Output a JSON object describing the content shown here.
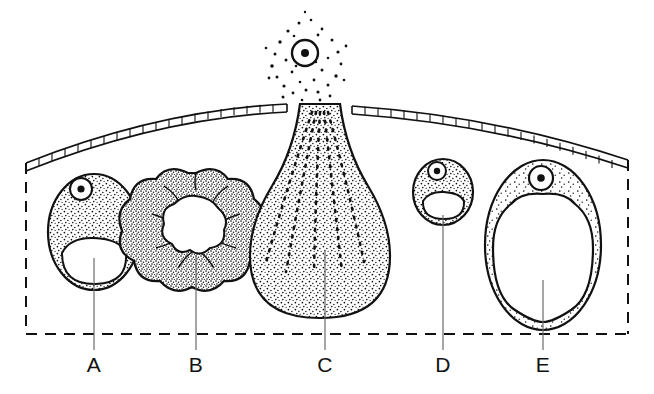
{
  "figure": {
    "title_text": "",
    "kind": "secretory-gland-cell-types-diagram",
    "background_color": "#ffffff",
    "ink_color": "#000000",
    "leader_color": "#6b6b6b"
  },
  "boundary": {
    "name": "tissue-boundary",
    "style": "dashed",
    "left_x": 26,
    "right_x": 628,
    "bottom_y": 334,
    "left_top_y": 163,
    "right_top_y": 160,
    "dash_pattern": "11 8"
  },
  "membrane": {
    "name": "basement-membrane",
    "description": "ladder-hatched arched membrane with a rupture gap at cell C",
    "gap_start_x": 287,
    "gap_end_x": 352,
    "left_start": {
      "x": 26,
      "y": 163
    },
    "apex": {
      "x": 300,
      "y": 105
    },
    "right_end": {
      "x": 628,
      "y": 160
    },
    "rungs": true
  },
  "cells": [
    {
      "id": "A",
      "name": "cell-a",
      "label": "A",
      "type": "resting-cell-with-vacuole",
      "center": {
        "x": 94,
        "y": 232
      },
      "radius_x": 46,
      "radius_y": 58,
      "cytoplasm": "stippled",
      "nucleus": {
        "x": 81,
        "y": 189,
        "r": 11,
        "visible": true
      },
      "vacuole": "crescent-lumen",
      "label_x": 94,
      "label_y": 372,
      "leader_from_y": 258,
      "leader_to_y": 350
    },
    {
      "id": "B",
      "name": "cell-b",
      "label": "B",
      "type": "lobulated-rosette-cell",
      "center": {
        "x": 196,
        "y": 225
      },
      "radius_x": 47,
      "radius_y": 52,
      "cytoplasm": "dense-stippled-lobed",
      "lobe_count": 10,
      "nucleus": {
        "visible": false
      },
      "vacuole": "star-shaped-central-lumen",
      "label_x": 196,
      "label_y": 372,
      "leader_from_y": 255,
      "leader_to_y": 350
    },
    {
      "id": "C",
      "name": "cell-c",
      "label": "C",
      "type": "discharging-flask-cell",
      "center": {
        "x": 320,
        "y": 235
      },
      "radius_x": 65,
      "radius_y": 85,
      "cytoplasm": "stippled-with-radial-secretion-streaks",
      "nucleus": {
        "x": 305,
        "y": 53,
        "r": 13,
        "visible": true,
        "position": "extruded-above-membrane"
      },
      "vacuole": "none",
      "granule_cloud": true,
      "label_x": 325,
      "label_y": 372,
      "leader_from_y": 250,
      "leader_to_y": 350
    },
    {
      "id": "D",
      "name": "cell-d",
      "label": "D",
      "type": "small-resting-cell",
      "center": {
        "x": 443,
        "y": 192
      },
      "radius_x": 30,
      "radius_y": 33,
      "cytoplasm": "stippled",
      "nucleus": {
        "x": 437,
        "y": 171,
        "r": 9,
        "visible": true
      },
      "vacuole": "crescent-lumen",
      "label_x": 443,
      "label_y": 372,
      "leader_from_y": 215,
      "leader_to_y": 350
    },
    {
      "id": "E",
      "name": "cell-e",
      "label": "E",
      "type": "distended-cell-with-large-vacuole",
      "center": {
        "x": 543,
        "y": 245
      },
      "radius_x": 58,
      "radius_y": 85,
      "cytoplasm": "thin-stippled-rim",
      "nucleus": {
        "x": 541,
        "y": 178,
        "r": 12,
        "visible": true
      },
      "vacuole": "large-central-lumen",
      "label_x": 543,
      "label_y": 372,
      "leader_from_y": 280,
      "leader_to_y": 350
    }
  ],
  "labels": {
    "a": "A",
    "b": "B",
    "c": "C",
    "d": "D",
    "e": "E"
  }
}
